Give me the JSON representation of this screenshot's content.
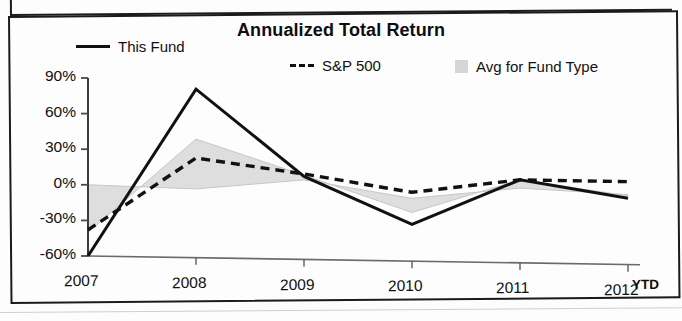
{
  "chart_data": {
    "type": "line",
    "title": "Annualized Total Return",
    "xlabel": "",
    "ylabel": "",
    "x": [
      "2007",
      "2008",
      "2009",
      "2010",
      "2011",
      "2012"
    ],
    "x_note": "YTD",
    "ylim": [
      -60,
      90
    ],
    "yticks": [
      90,
      60,
      30,
      0,
      -30,
      -60
    ],
    "ytick_labels": [
      "90%",
      "60%",
      "30%",
      "0%",
      "-30%",
      "-60%"
    ],
    "grid": false,
    "legend_position": "top",
    "series": [
      {
        "name": "This Fund",
        "style": "solid",
        "color": "#111111",
        "values": [
          -60,
          80,
          6,
          -35,
          2,
          -14
        ]
      },
      {
        "name": "S&P 500",
        "style": "dashed",
        "color": "#111111",
        "values": [
          -38,
          22,
          8,
          -8,
          2,
          0
        ]
      },
      {
        "name": "Avg for Fund Type",
        "style": "band",
        "color": "#d6d6d6",
        "values": [
          -40,
          38,
          7,
          -25,
          2,
          -12
        ]
      }
    ],
    "band_baseline": [
      0,
      -4,
      3,
      -13,
      -5,
      -11
    ]
  },
  "legend": {
    "items": [
      {
        "label": "This Fund",
        "marker": "solid-line-swatch"
      },
      {
        "label": "S&P 500",
        "marker": "dashed-line-swatch"
      },
      {
        "label": "Avg for Fund Type",
        "marker": "gray-box-swatch"
      }
    ]
  },
  "axes": {
    "y_ticks": [
      "90%",
      "60%",
      "30%",
      "0%",
      "-30%",
      "-60%"
    ],
    "x_ticks": [
      "2007",
      "2008",
      "2009",
      "2010",
      "2011",
      "2012"
    ],
    "x_suffix": "YTD"
  }
}
